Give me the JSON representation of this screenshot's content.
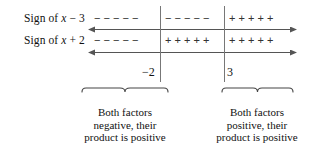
{
  "figure": {
    "type": "sign-chart",
    "rows": [
      {
        "label_prefix": "Sign of ",
        "label_var": "x",
        "label_suffix": " − 3",
        "label_full": "Sign of x − 3",
        "segments": [
          {
            "region": "x < -2",
            "sign": "−",
            "symbols": "− − − − −"
          },
          {
            "region": "-2 < x < 3",
            "sign": "−",
            "symbols": "− − − − −"
          },
          {
            "region": "x > 3",
            "sign": "+",
            "symbols": "+ + + + +"
          }
        ]
      },
      {
        "label_prefix": "Sign of ",
        "label_var": "x",
        "label_suffix": " + 2",
        "label_full": "Sign of x + 2",
        "segments": [
          {
            "region": "x < -2",
            "sign": "−",
            "symbols": "− − − − −"
          },
          {
            "region": "-2 < x < 3",
            "sign": "+",
            "symbols": "+ + + + +"
          },
          {
            "region": "x > 3",
            "sign": "+",
            "symbols": "+ + + + +"
          }
        ]
      }
    ],
    "ticks": [
      {
        "value": "−2"
      },
      {
        "value": "3"
      }
    ],
    "braces": [
      {
        "line1": "Both factors",
        "line2": "negative, their",
        "line3": "product is positive"
      },
      {
        "line1": "Both factors",
        "line2": "positive, their",
        "line3": "product is positive"
      }
    ],
    "colors": {
      "ink": "#1a1a1a",
      "rule": "#555555",
      "background": "#ffffff"
    }
  }
}
